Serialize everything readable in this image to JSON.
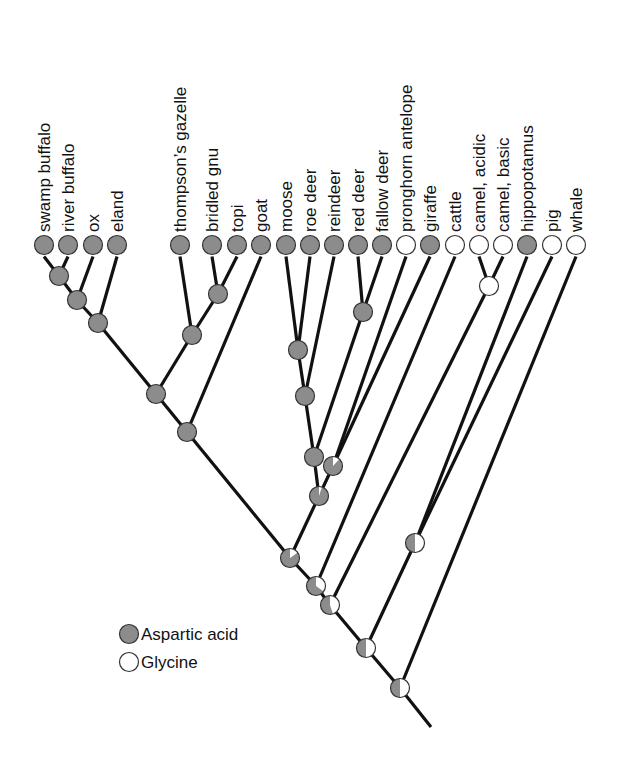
{
  "colors": {
    "aspartic": "#8c8c8c",
    "glycine": "#ffffff",
    "line": "#111111",
    "outline": "#333333"
  },
  "legend": {
    "items": [
      {
        "label": "Aspartic acid",
        "state": "aspartic"
      },
      {
        "label": "Glycine",
        "state": "glycine"
      }
    ]
  },
  "tips": [
    {
      "id": "swamp_buffalo",
      "label": "swamp buffalo",
      "x": 44,
      "state": "aspartic"
    },
    {
      "id": "river_buffalo",
      "label": "river buffalo",
      "x": 68,
      "state": "aspartic"
    },
    {
      "id": "ox",
      "label": "ox",
      "x": 93,
      "state": "aspartic"
    },
    {
      "id": "eland",
      "label": "eland",
      "x": 117,
      "state": "aspartic"
    },
    {
      "id": "thompsons_gazelle",
      "label": "thompson’s gazelle",
      "x": 180,
      "state": "aspartic"
    },
    {
      "id": "bridled_gnu",
      "label": "bridled gnu",
      "x": 212,
      "state": "aspartic"
    },
    {
      "id": "topi",
      "label": "topi",
      "x": 237,
      "state": "aspartic"
    },
    {
      "id": "goat",
      "label": "goat",
      "x": 261,
      "state": "aspartic"
    },
    {
      "id": "moose",
      "label": "moose",
      "x": 286,
      "state": "aspartic"
    },
    {
      "id": "roe_deer",
      "label": "roe deer",
      "x": 310,
      "state": "aspartic"
    },
    {
      "id": "reindeer",
      "label": "reindeer",
      "x": 334,
      "state": "aspartic"
    },
    {
      "id": "red_deer",
      "label": "red deer",
      "x": 358,
      "state": "aspartic"
    },
    {
      "id": "fallow_deer",
      "label": "fallow deer",
      "x": 382,
      "state": "aspartic"
    },
    {
      "id": "pronghorn_antelope",
      "label": "pronghorn antelope",
      "x": 406,
      "state": "glycine"
    },
    {
      "id": "giraffe",
      "label": "giraffe",
      "x": 430,
      "state": "aspartic"
    },
    {
      "id": "cattle",
      "label": "cattle",
      "x": 455,
      "state": "glycine"
    },
    {
      "id": "camel_acidic",
      "label": "camel, acidic",
      "x": 479,
      "state": "glycine"
    },
    {
      "id": "camel_basic",
      "label": "camel, basic",
      "x": 503,
      "state": "glycine"
    },
    {
      "id": "hippopotamus",
      "label": "hippopotamus",
      "x": 527,
      "state": "aspartic"
    },
    {
      "id": "pig",
      "label": "pig",
      "x": 552,
      "state": "glycine"
    },
    {
      "id": "whale",
      "label": "whale",
      "x": 576,
      "state": "glycine"
    }
  ],
  "tip_y": 245,
  "internal_nodes": [
    {
      "id": "n_buffalo",
      "x": 59,
      "y": 276,
      "glycine_frac": 0,
      "children": [
        "swamp_buffalo",
        "river_buffalo"
      ]
    },
    {
      "id": "n_ox",
      "x": 77,
      "y": 300,
      "glycine_frac": 0,
      "children": [
        "n_buffalo",
        "ox"
      ]
    },
    {
      "id": "n_eland",
      "x": 98,
      "y": 323,
      "glycine_frac": 0,
      "children": [
        "n_ox",
        "eland"
      ]
    },
    {
      "id": "n_gnu_topi",
      "x": 218,
      "y": 294,
      "glycine_frac": 0,
      "children": [
        "bridled_gnu",
        "topi"
      ]
    },
    {
      "id": "n_antelopini",
      "x": 192,
      "y": 335,
      "glycine_frac": 0,
      "children": [
        "thompsons_gazelle",
        "n_gnu_topi"
      ]
    },
    {
      "id": "n_bovidae_a",
      "x": 156,
      "y": 394,
      "glycine_frac": 0,
      "children": [
        "n_eland",
        "n_antelopini"
      ]
    },
    {
      "id": "n_bovidae",
      "x": 187,
      "y": 432,
      "glycine_frac": 0,
      "children": [
        "n_bovidae_a",
        "goat"
      ]
    },
    {
      "id": "n_moose_roe",
      "x": 298,
      "y": 350,
      "glycine_frac": 0,
      "children": [
        "moose",
        "roe_deer"
      ]
    },
    {
      "id": "n_reindeer",
      "x": 305,
      "y": 396,
      "glycine_frac": 0,
      "children": [
        "n_moose_roe",
        "reindeer"
      ]
    },
    {
      "id": "n_cervus",
      "x": 363,
      "y": 312,
      "glycine_frac": 0,
      "children": [
        "red_deer",
        "fallow_deer"
      ]
    },
    {
      "id": "n_cervidae",
      "x": 314,
      "y": 457,
      "glycine_frac": 0,
      "children": [
        "n_reindeer",
        "n_cervus"
      ]
    },
    {
      "id": "n_prong_giraffe",
      "x": 333,
      "y": 466,
      "glycine_frac": 0.12,
      "children": [
        "pronghorn_antelope",
        "giraffe"
      ]
    },
    {
      "id": "n_cervoidea",
      "x": 319,
      "y": 496,
      "glycine_frac": 0.05,
      "children": [
        "n_cervidae",
        "n_prong_giraffe"
      ]
    },
    {
      "id": "n_pecora",
      "x": 290,
      "y": 558,
      "glycine_frac": 0.15,
      "children": [
        "n_bovidae",
        "n_cervoidea"
      ]
    },
    {
      "id": "n_cattle",
      "x": 316,
      "y": 586,
      "glycine_frac": 0.35,
      "children": [
        "n_pecora",
        "cattle"
      ]
    },
    {
      "id": "n_camel",
      "x": 489,
      "y": 286,
      "glycine_frac": 1,
      "children": [
        "camel_acidic",
        "camel_basic"
      ]
    },
    {
      "id": "n_hippo_pig",
      "x": 415,
      "y": 543,
      "glycine_frac": 0.5,
      "children": [
        "hippopotamus",
        "pig"
      ]
    },
    {
      "id": "n_ruminant_camel",
      "x": 330,
      "y": 605,
      "glycine_frac": 0.45,
      "children": [
        "n_cattle",
        "n_camel"
      ]
    },
    {
      "id": "n_suina",
      "x": 366,
      "y": 648,
      "glycine_frac": 0.5,
      "children": [
        "n_ruminant_camel",
        "n_hippo_pig"
      ]
    },
    {
      "id": "n_root",
      "x": 400,
      "y": 688,
      "glycine_frac": 0.5,
      "children": [
        "n_suina",
        "whale"
      ]
    }
  ],
  "root_tail": {
    "x": 431,
    "y": 727
  },
  "node_radius": 9.5
}
